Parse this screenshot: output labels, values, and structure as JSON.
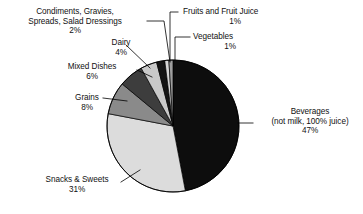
{
  "chart_data": {
    "type": "pie",
    "title": "",
    "subtitle": "",
    "xlabel": "",
    "ylabel": "",
    "legend_position": "callout-labels",
    "grid": false,
    "units": "percent",
    "start_angle_deg": 0,
    "direction": "clockwise",
    "categories": [
      "Beverages (not milk, 100% juice)",
      "Snacks & Sweets",
      "Grains",
      "Mixed Dishes",
      "Dairy",
      "Condiments, Gravies, Spreads, Salad Dressings",
      "Fruits and Fruit Juice",
      "Vegetables"
    ],
    "values": [
      47,
      31,
      8,
      6,
      4,
      2,
      1,
      1
    ],
    "slices": [
      {
        "key": "beverages",
        "name_line1": "Beverages",
        "name_line2": "(not milk, 100% juice)",
        "value": 47,
        "percent_label": "47%",
        "color": "#0d0d0d"
      },
      {
        "key": "snacks",
        "name_line1": "Snacks & Sweets",
        "name_line2": "",
        "value": 31,
        "percent_label": "31%",
        "color": "#dcdcdc"
      },
      {
        "key": "grains",
        "name_line1": "Grains",
        "name_line2": "",
        "value": 8,
        "percent_label": "8%",
        "color": "#8a8a8a"
      },
      {
        "key": "mixed-dishes",
        "name_line1": "Mixed Dishes",
        "name_line2": "",
        "value": 6,
        "percent_label": "6%",
        "color": "#3d3d3d"
      },
      {
        "key": "dairy",
        "name_line1": "Dairy",
        "name_line2": "",
        "value": 4,
        "percent_label": "4%",
        "color": "#c9c9c9"
      },
      {
        "key": "condiments",
        "name_line1": "Condiments, Gravies,",
        "name_line2": "Spreads, Salad Dressings",
        "value": 2,
        "percent_label": "2%",
        "color": "#141414"
      },
      {
        "key": "fruits",
        "name_line1": "Fruits and Fruit Juice",
        "name_line2": "",
        "value": 1,
        "percent_label": "1%",
        "color": "#d6d6d6"
      },
      {
        "key": "vegetables",
        "name_line1": "Vegetables",
        "name_line2": "",
        "value": 1,
        "percent_label": "1%",
        "color": "#9e9e9e"
      }
    ]
  },
  "colors": {
    "background": "#ffffff",
    "text": "#111111",
    "outline": "#000000",
    "leader_line": "#000000"
  }
}
